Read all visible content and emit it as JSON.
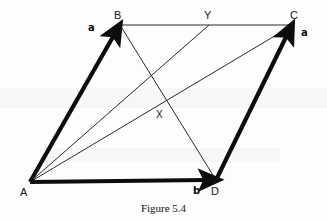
{
  "figure": {
    "caption": "Figure 5.4",
    "background_color": "#fdfdfd",
    "stroke_color": "#111111",
    "vertices": [
      {
        "id": "A",
        "label": "A",
        "x": 30,
        "y": 182,
        "label_x": 20,
        "label_y": 187
      },
      {
        "id": "B",
        "label": "B",
        "x": 120,
        "y": 25,
        "label_x": 114,
        "label_y": 10
      },
      {
        "id": "C",
        "label": "C",
        "x": 293,
        "y": 25,
        "label_x": 290,
        "label_y": 10
      },
      {
        "id": "D",
        "label": "D",
        "x": 216,
        "y": 180,
        "label_x": 211,
        "label_y": 186
      },
      {
        "id": "X",
        "label": "X",
        "x": 164,
        "y": 103,
        "label_x": 156,
        "label_y": 110
      },
      {
        "id": "Y",
        "label": "Y",
        "x": 209,
        "y": 25,
        "label_x": 204,
        "label_y": 10
      }
    ],
    "vectors": [
      {
        "id": "AB",
        "label": "a",
        "from": "A",
        "to": "B",
        "label_x": 88,
        "label_y": 23,
        "style": "bold-arrow"
      },
      {
        "id": "AD",
        "label": "b",
        "from": "A",
        "to": "D",
        "label_x": 193,
        "label_y": 186,
        "style": "bold-arrow"
      },
      {
        "id": "DC",
        "label": "a",
        "from": "D",
        "to": "C",
        "label_x": 301,
        "label_y": 28,
        "style": "bold-arrow"
      }
    ],
    "thin_lines": [
      {
        "id": "BC",
        "from": "B",
        "to": "C"
      },
      {
        "id": "BD",
        "from": "B",
        "to": "D"
      },
      {
        "id": "AC",
        "from": "A",
        "to": "C"
      },
      {
        "id": "AY",
        "from": "A",
        "to": "Y"
      }
    ]
  }
}
